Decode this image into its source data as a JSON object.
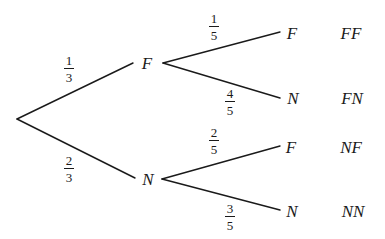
{
  "diagram": {
    "type": "probability-tree",
    "line_color": "#1a1a1a",
    "root": {
      "x": 17,
      "y": 119
    },
    "level1": [
      {
        "label": "F",
        "probability": {
          "numerator": "1",
          "denominator": "3"
        },
        "children": [
          {
            "label": "F",
            "outcome": "FF",
            "probability": {
              "numerator": "1",
              "denominator": "5"
            }
          },
          {
            "label": "N",
            "outcome": "FN",
            "probability": {
              "numerator": "4",
              "denominator": "5"
            }
          }
        ]
      },
      {
        "label": "N",
        "probability": {
          "numerator": "2",
          "denominator": "3"
        },
        "children": [
          {
            "label": "F",
            "outcome": "NF",
            "probability": {
              "numerator": "2",
              "denominator": "5"
            }
          },
          {
            "label": "N",
            "outcome": "NN",
            "probability": {
              "numerator": "3",
              "denominator": "5"
            }
          }
        ]
      }
    ]
  }
}
